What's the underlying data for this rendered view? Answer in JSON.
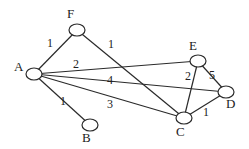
{
  "graph": {
    "nodes": [
      {
        "id": "A",
        "label": "A",
        "x": 34,
        "y": 74,
        "lx": 14,
        "ly": 71
      },
      {
        "id": "F",
        "label": "F",
        "x": 77,
        "y": 30,
        "lx": 67,
        "ly": 18
      },
      {
        "id": "E",
        "label": "E",
        "x": 198,
        "y": 61,
        "lx": 189,
        "ly": 50
      },
      {
        "id": "D",
        "label": "D",
        "x": 226,
        "y": 92,
        "lx": 226,
        "ly": 108
      },
      {
        "id": "C",
        "label": "C",
        "x": 184,
        "y": 118,
        "lx": 176,
        "ly": 136
      },
      {
        "id": "B",
        "label": "B",
        "x": 90,
        "y": 125,
        "lx": 82,
        "ly": 142
      }
    ],
    "edges": [
      {
        "from": "A",
        "to": "F",
        "weight": "1",
        "wx": 47,
        "wy": 47
      },
      {
        "from": "F",
        "to": "C",
        "weight": "1",
        "wx": 108,
        "wy": 48
      },
      {
        "from": "A",
        "to": "E",
        "weight": "2",
        "wx": 73,
        "wy": 68
      },
      {
        "from": "A",
        "to": "D",
        "weight": "4",
        "wx": 107,
        "wy": 84
      },
      {
        "from": "A",
        "to": "C",
        "weight": "3",
        "wx": 107,
        "wy": 108
      },
      {
        "from": "A",
        "to": "B",
        "weight": "1",
        "wx": 60,
        "wy": 105
      },
      {
        "from": "E",
        "to": "C",
        "weight": "2",
        "wx": 185,
        "wy": 80
      },
      {
        "from": "E",
        "to": "D",
        "weight": "5",
        "wx": 209,
        "wy": 79
      },
      {
        "from": "C",
        "to": "D",
        "weight": "1",
        "wx": 203,
        "wy": 116
      }
    ]
  }
}
